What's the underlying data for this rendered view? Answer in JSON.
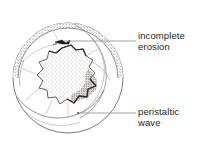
{
  "figure": {
    "kind": "anatomical-line-drawing",
    "title": "",
    "background_color": "#ffffff",
    "ink_color": "#231f20",
    "line_color": "#6b6b6b",
    "leader_color": "#8a8a8a"
  },
  "labels": [
    {
      "id": "incomplete-erosion",
      "text": "incomplete\nerosion",
      "line1": "incomplete",
      "line2": "erosion",
      "x": 138,
      "y": 31
    },
    {
      "id": "peristaltic-wave",
      "text": "peristaltic\nwave",
      "line1": "peristaltic",
      "line2": "wave",
      "x": 138,
      "y": 107
    }
  ],
  "leader_lines": [
    {
      "id": "leader-incomplete-erosion",
      "from_x": 136,
      "from_y": 41,
      "to_x": 64,
      "to_y": 41,
      "points_to": "incomplete-erosion"
    },
    {
      "id": "leader-peristaltic-wave",
      "from_x": 136,
      "from_y": 113,
      "to_x": 78,
      "to_y": 113,
      "points_to": "peristaltic-wave"
    }
  ],
  "drawing": {
    "outer_circle": {
      "cx": 68,
      "cy": 78,
      "r": 55
    },
    "inner_rim_circle": {
      "cx": 68,
      "cy": 78,
      "r": 50
    },
    "central_mass": {
      "name": "eroded-mucosa-patch",
      "fill": "stipple",
      "border": "jagged-dark"
    },
    "erosion_mark": {
      "cx": 62,
      "cy": 42,
      "w": 14,
      "h": 5
    },
    "peristaltic_fold_count": 5,
    "stipple_band": "upper-rim"
  }
}
